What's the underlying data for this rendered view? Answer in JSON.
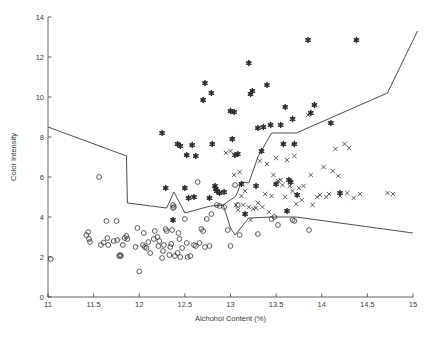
{
  "chart_data": {
    "type": "scatter",
    "title": "",
    "xlabel": "Alchohol Content (%)",
    "ylabel": "Color Intensity",
    "xlim": [
      11,
      15
    ],
    "ylim": [
      0,
      14
    ],
    "xticks": [
      11,
      11.5,
      12,
      12.5,
      13,
      13.5,
      14,
      14.5,
      15
    ],
    "xticklabels": [
      "11",
      "11.5",
      "12",
      "12.5",
      "13",
      "13.5",
      "14",
      "14.5",
      "15"
    ],
    "yticks": [
      0,
      2,
      4,
      6,
      8,
      10,
      12,
      14
    ],
    "yticklabels": [
      "0",
      "2",
      "4",
      "6",
      "8",
      "10",
      "12",
      "14"
    ],
    "grid": false,
    "legend": null,
    "marker_color": "#2b2b2b",
    "line_color": "#3a3a3a",
    "series": [
      {
        "name": "class-circle",
        "marker": "circle",
        "points": [
          [
            11.03,
            1.9
          ],
          [
            11.42,
            3.1
          ],
          [
            11.44,
            3.25
          ],
          [
            11.45,
            2.9
          ],
          [
            11.46,
            2.75
          ],
          [
            11.56,
            6.0
          ],
          [
            11.58,
            2.6
          ],
          [
            11.61,
            2.72
          ],
          [
            11.64,
            3.8
          ],
          [
            11.65,
            2.95
          ],
          [
            11.66,
            2.6
          ],
          [
            11.72,
            2.8
          ],
          [
            11.75,
            3.8
          ],
          [
            11.76,
            2.85
          ],
          [
            11.78,
            2.05
          ],
          [
            11.79,
            2.1
          ],
          [
            11.8,
            2.05
          ],
          [
            11.82,
            2.6
          ],
          [
            11.84,
            2.95
          ],
          [
            11.86,
            3.05
          ],
          [
            11.87,
            2.9
          ],
          [
            11.96,
            2.5
          ],
          [
            11.98,
            3.45
          ],
          [
            12.0,
            1.28
          ],
          [
            12.04,
            2.6
          ],
          [
            12.05,
            3.2
          ],
          [
            12.06,
            2.5
          ],
          [
            12.08,
            2.45
          ],
          [
            12.1,
            2.75
          ],
          [
            12.12,
            2.2
          ],
          [
            12.16,
            2.9
          ],
          [
            12.17,
            3.3
          ],
          [
            12.2,
            3.0
          ],
          [
            12.21,
            2.55
          ],
          [
            12.22,
            2.8
          ],
          [
            12.25,
            1.95
          ],
          [
            12.26,
            2.3
          ],
          [
            12.27,
            2.6
          ],
          [
            12.29,
            3.4
          ],
          [
            12.3,
            3.3
          ],
          [
            12.33,
            2.1
          ],
          [
            12.34,
            2.5
          ],
          [
            12.35,
            2.65
          ],
          [
            12.36,
            3.35
          ],
          [
            12.37,
            4.6
          ],
          [
            12.37,
            4.45
          ],
          [
            12.38,
            4.5
          ],
          [
            12.39,
            2.05
          ],
          [
            12.42,
            2.2
          ],
          [
            12.43,
            3.2
          ],
          [
            12.44,
            2.9
          ],
          [
            12.45,
            2.0
          ],
          [
            12.47,
            2.45
          ],
          [
            12.5,
            3.9
          ],
          [
            12.52,
            2.7
          ],
          [
            12.53,
            2.0
          ],
          [
            12.56,
            2.05
          ],
          [
            12.6,
            2.6
          ],
          [
            12.62,
            2.55
          ],
          [
            12.64,
            5.75
          ],
          [
            12.66,
            2.7
          ],
          [
            12.68,
            3.4
          ],
          [
            12.7,
            3.3
          ],
          [
            12.72,
            2.5
          ],
          [
            12.74,
            3.9
          ],
          [
            12.77,
            2.55
          ],
          [
            12.79,
            4.15
          ],
          [
            12.85,
            4.6
          ],
          [
            12.88,
            4.55
          ],
          [
            12.93,
            4.5
          ],
          [
            12.97,
            3.35
          ],
          [
            13.0,
            2.55
          ],
          [
            13.05,
            5.6
          ],
          [
            13.08,
            4.6
          ],
          [
            13.1,
            3.1
          ],
          [
            13.3,
            3.15
          ],
          [
            13.45,
            3.9
          ],
          [
            13.48,
            4.0
          ],
          [
            13.52,
            3.6
          ],
          [
            13.68,
            3.85
          ],
          [
            13.7,
            3.8
          ],
          [
            13.86,
            3.35
          ]
        ]
      },
      {
        "name": "class-asterisk",
        "marker": "asterisk",
        "points": [
          [
            12.25,
            8.2
          ],
          [
            12.29,
            5.45
          ],
          [
            12.37,
            3.85
          ],
          [
            12.42,
            7.65
          ],
          [
            12.45,
            7.55
          ],
          [
            12.5,
            5.45
          ],
          [
            12.52,
            7.1
          ],
          [
            12.54,
            4.95
          ],
          [
            12.58,
            7.6
          ],
          [
            12.6,
            5.0
          ],
          [
            12.62,
            7.05
          ],
          [
            12.7,
            9.85
          ],
          [
            12.72,
            10.7
          ],
          [
            12.77,
            4.95
          ],
          [
            12.79,
            10.2
          ],
          [
            12.8,
            7.65
          ],
          [
            12.83,
            5.55
          ],
          [
            12.84,
            5.4
          ],
          [
            12.85,
            5.3
          ],
          [
            12.88,
            5.2
          ],
          [
            12.93,
            5.25
          ],
          [
            13.0,
            9.3
          ],
          [
            13.02,
            7.9
          ],
          [
            13.04,
            9.25
          ],
          [
            13.05,
            7.1
          ],
          [
            13.08,
            7.15
          ],
          [
            13.12,
            5.65
          ],
          [
            13.16,
            4.15
          ],
          [
            13.2,
            11.7
          ],
          [
            13.22,
            10.15
          ],
          [
            13.24,
            10.3
          ],
          [
            13.28,
            5.55
          ],
          [
            13.3,
            8.45
          ],
          [
            13.34,
            7.3
          ],
          [
            13.36,
            8.5
          ],
          [
            13.4,
            10.6
          ],
          [
            13.44,
            8.6
          ],
          [
            13.5,
            5.65
          ],
          [
            13.55,
            8.6
          ],
          [
            13.58,
            7.65
          ],
          [
            13.6,
            9.5
          ],
          [
            13.62,
            4.3
          ],
          [
            13.64,
            5.85
          ],
          [
            13.66,
            5.75
          ],
          [
            13.68,
            8.9
          ],
          [
            13.7,
            7.65
          ],
          [
            13.73,
            5.1
          ],
          [
            13.85,
            12.85
          ],
          [
            13.88,
            9.2
          ],
          [
            13.92,
            9.6
          ],
          [
            14.1,
            8.7
          ],
          [
            14.2,
            5.2
          ],
          [
            14.38,
            12.85
          ]
        ]
      },
      {
        "name": "class-x",
        "marker": "x",
        "points": [
          [
            12.95,
            7.2
          ],
          [
            13.0,
            7.3
          ],
          [
            13.04,
            6.1
          ],
          [
            13.06,
            4.6
          ],
          [
            13.08,
            4.35
          ],
          [
            13.1,
            6.25
          ],
          [
            13.12,
            5.05
          ],
          [
            13.14,
            4.6
          ],
          [
            13.16,
            5.3
          ],
          [
            13.2,
            4.5
          ],
          [
            13.22,
            3.85
          ],
          [
            13.25,
            4.4
          ],
          [
            13.28,
            4.45
          ],
          [
            13.3,
            4.7
          ],
          [
            13.32,
            6.8
          ],
          [
            13.35,
            4.5
          ],
          [
            13.38,
            5.15
          ],
          [
            13.4,
            6.65
          ],
          [
            13.42,
            4.25
          ],
          [
            13.45,
            5.05
          ],
          [
            13.47,
            6.1
          ],
          [
            13.5,
            6.95
          ],
          [
            13.52,
            5.8
          ],
          [
            13.55,
            5.85
          ],
          [
            13.57,
            5.6
          ],
          [
            13.6,
            5.0
          ],
          [
            13.62,
            6.85
          ],
          [
            13.65,
            5.55
          ],
          [
            13.68,
            5.3
          ],
          [
            13.7,
            7.05
          ],
          [
            13.72,
            4.65
          ],
          [
            13.75,
            5.45
          ],
          [
            13.78,
            4.85
          ],
          [
            13.8,
            5.55
          ],
          [
            13.85,
            9.1
          ],
          [
            13.88,
            6.1
          ],
          [
            13.9,
            4.6
          ],
          [
            13.95,
            5.0
          ],
          [
            13.98,
            5.1
          ],
          [
            14.02,
            6.5
          ],
          [
            14.05,
            5.0
          ],
          [
            14.08,
            5.15
          ],
          [
            14.12,
            6.3
          ],
          [
            14.15,
            7.4
          ],
          [
            14.18,
            6.05
          ],
          [
            14.2,
            5.05
          ],
          [
            14.25,
            7.65
          ],
          [
            14.28,
            5.2
          ],
          [
            14.3,
            7.45
          ],
          [
            14.35,
            4.95
          ],
          [
            14.42,
            5.15
          ],
          [
            14.72,
            5.2
          ],
          [
            14.78,
            5.15
          ]
        ]
      }
    ],
    "boundaries": [
      {
        "name": "upper-left-boundary",
        "path": [
          [
            11.0,
            8.5
          ],
          [
            11.86,
            7.05
          ],
          [
            11.87,
            4.7
          ],
          [
            12.3,
            4.45
          ],
          [
            12.38,
            5.25
          ],
          [
            12.5,
            4.2
          ],
          [
            12.78,
            4.55
          ],
          [
            12.92,
            4.6
          ],
          [
            13.06,
            5.05
          ],
          [
            13.12,
            5.75
          ],
          [
            13.2,
            5.7
          ],
          [
            13.3,
            7.0
          ],
          [
            13.45,
            8.2
          ],
          [
            13.72,
            8.2
          ],
          [
            14.72,
            10.2
          ],
          [
            15.05,
            13.3
          ]
        ]
      },
      {
        "name": "center-polygon-boundary",
        "path": [
          [
            12.92,
            4.6
          ],
          [
            13.0,
            3.45
          ],
          [
            13.05,
            3.1
          ],
          [
            13.2,
            3.95
          ],
          [
            13.45,
            4.0
          ],
          [
            13.72,
            4.0
          ],
          [
            15.0,
            3.2
          ]
        ]
      }
    ]
  }
}
